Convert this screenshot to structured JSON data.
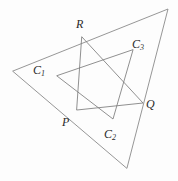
{
  "figure": {
    "kind": "geometry-diagram",
    "width": 178,
    "height": 181,
    "background_color": "#fdfdfd",
    "line_color": "#7c7c7c",
    "label_color": "#2a2a2a"
  },
  "labels": {
    "R": {
      "text": "R",
      "sub": "",
      "x": 76,
      "y": 18
    },
    "C1": {
      "text": "C",
      "sub": "1",
      "x": 33,
      "y": 64
    },
    "C3": {
      "text": "C",
      "sub": "3",
      "x": 132,
      "y": 38
    },
    "Q": {
      "text": "Q",
      "sub": "",
      "x": 146,
      "y": 98
    },
    "P": {
      "text": "P",
      "sub": "",
      "x": 62,
      "y": 116
    },
    "C2": {
      "text": "C",
      "sub": "2",
      "x": 104,
      "y": 128
    }
  },
  "points": {
    "R": {
      "x": 82,
      "y": 37
    },
    "P": {
      "x": 77,
      "y": 110
    },
    "Q": {
      "x": 143,
      "y": 103
    },
    "C1": {
      "x": 57,
      "y": 76
    },
    "C2": {
      "x": 113,
      "y": 119
    },
    "C3": {
      "x": 133,
      "y": 50
    },
    "A": {
      "x": 13,
      "y": 71
    },
    "B": {
      "x": 168,
      "y": 9
    },
    "C": {
      "x": 127,
      "y": 168
    }
  },
  "shapes": [
    {
      "name": "outer-triangle",
      "vertices": [
        "A",
        "B",
        "C"
      ],
      "closed": true
    },
    {
      "name": "triangle-pqr",
      "vertices": [
        "P",
        "Q",
        "R"
      ],
      "closed": true
    },
    {
      "name": "triangle-c1c2c3",
      "vertices": [
        "C1",
        "C2",
        "C3"
      ],
      "closed": true
    }
  ]
}
